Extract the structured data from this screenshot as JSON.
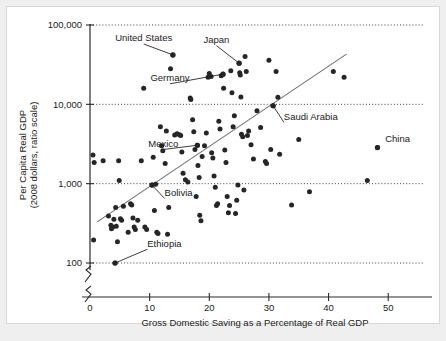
{
  "figure": {
    "background_color": "#efefef",
    "card_color": "#ffffff",
    "point_color": "#262626",
    "trend_color": "#6f6f6f"
  },
  "chart_data": {
    "type": "scatter",
    "title": "",
    "subtitle": "",
    "xlabel": "Gross Domestic Saving as a Percentage of Real GDP",
    "ylabel": "Per Capita Real GDP\n(2008 dollars, ratio scale)",
    "ylabel_line1": "Per Capita Real GDP",
    "ylabel_line2": "(2008 dollars, ratio scale)",
    "yscale": "log",
    "xscale": "linear",
    "xlim": [
      0,
      56
    ],
    "ylim": [
      100,
      100000
    ],
    "grid": true,
    "grid_axis": "y",
    "legend": "none",
    "xticks": [
      0,
      10,
      20,
      30,
      40,
      50
    ],
    "xtick_labels": [
      "0",
      "10",
      "20",
      "30",
      "40",
      "50"
    ],
    "yticks": [
      100,
      1000,
      10000,
      100000
    ],
    "ytick_labels": [
      "100",
      "1,000",
      "10,000",
      "100,000"
    ],
    "axis_break": true,
    "trendline": {
      "type": "linear-on-log",
      "x_start": 1.2,
      "y_start": 330,
      "x_end": 43.0,
      "y_end": 43000
    },
    "annotations": [
      {
        "label": "United States",
        "x": 13.9,
        "y": 42000,
        "label_x": 9.0,
        "label_y": 62000,
        "leader": true
      },
      {
        "label": "Japan",
        "x": 25.0,
        "y": 33000,
        "label_x": 21.2,
        "label_y": 59000,
        "leader": true
      },
      {
        "label": "Germany",
        "x": 22.3,
        "y": 24000,
        "label_x": 13.4,
        "label_y": 19500,
        "leader": true
      },
      {
        "label": "Saudi Arabia",
        "x": 30.7,
        "y": 9600,
        "label_x": 32.5,
        "label_y": 6400,
        "leader": true
      },
      {
        "label": "Mexico",
        "x": 18.0,
        "y": 3050,
        "label_x": 12.3,
        "label_y": 2900,
        "leader": true
      },
      {
        "label": "Bolivia",
        "x": 10.4,
        "y": 960,
        "label_x": 12.5,
        "label_y": 700,
        "leader": true
      },
      {
        "label": "Ethiopia",
        "x": 4.2,
        "y": 100,
        "label_x": 9.6,
        "label_y": 160,
        "leader": true
      },
      {
        "label": "China",
        "x": 48.2,
        "y": 2850,
        "label_x": 49.5,
        "label_y": 3400,
        "leader": false
      }
    ],
    "points": [
      {
        "x": 0.5,
        "y": 2300
      },
      {
        "x": 0.7,
        "y": 1850
      },
      {
        "x": 0.6,
        "y": 195
      },
      {
        "x": 2.2,
        "y": 1950
      },
      {
        "x": 3.1,
        "y": 390
      },
      {
        "x": 3.5,
        "y": 300
      },
      {
        "x": 3.6,
        "y": 270
      },
      {
        "x": 3.8,
        "y": 285
      },
      {
        "x": 4.0,
        "y": 355
      },
      {
        "x": 4.2,
        "y": 100
      },
      {
        "x": 4.3,
        "y": 500
      },
      {
        "x": 4.4,
        "y": 290
      },
      {
        "x": 4.6,
        "y": 185
      },
      {
        "x": 4.8,
        "y": 1950
      },
      {
        "x": 4.9,
        "y": 1100
      },
      {
        "x": 5.1,
        "y": 360
      },
      {
        "x": 5.3,
        "y": 345
      },
      {
        "x": 5.6,
        "y": 520
      },
      {
        "x": 6.4,
        "y": 245
      },
      {
        "x": 6.8,
        "y": 560
      },
      {
        "x": 7.0,
        "y": 540
      },
      {
        "x": 7.2,
        "y": 370
      },
      {
        "x": 7.4,
        "y": 285
      },
      {
        "x": 7.6,
        "y": 265
      },
      {
        "x": 8.0,
        "y": 345
      },
      {
        "x": 8.6,
        "y": 1950
      },
      {
        "x": 9.0,
        "y": 16000
      },
      {
        "x": 9.2,
        "y": 285
      },
      {
        "x": 9.5,
        "y": 265
      },
      {
        "x": 10.4,
        "y": 960
      },
      {
        "x": 10.6,
        "y": 2150
      },
      {
        "x": 10.8,
        "y": 460
      },
      {
        "x": 11.0,
        "y": 980
      },
      {
        "x": 11.2,
        "y": 245
      },
      {
        "x": 11.4,
        "y": 235
      },
      {
        "x": 11.8,
        "y": 5200
      },
      {
        "x": 12.0,
        "y": 3000
      },
      {
        "x": 12.2,
        "y": 2600
      },
      {
        "x": 12.6,
        "y": 1800
      },
      {
        "x": 12.8,
        "y": 4600
      },
      {
        "x": 13.0,
        "y": 230
      },
      {
        "x": 13.2,
        "y": 500
      },
      {
        "x": 13.5,
        "y": 28000
      },
      {
        "x": 13.9,
        "y": 42000
      },
      {
        "x": 14.2,
        "y": 4100
      },
      {
        "x": 14.6,
        "y": 4250
      },
      {
        "x": 15.0,
        "y": 4150
      },
      {
        "x": 15.2,
        "y": 4050
      },
      {
        "x": 15.4,
        "y": 2500
      },
      {
        "x": 15.6,
        "y": 1350
      },
      {
        "x": 16.0,
        "y": 1120
      },
      {
        "x": 16.4,
        "y": 1050
      },
      {
        "x": 16.8,
        "y": 12000
      },
      {
        "x": 16.9,
        "y": 11500
      },
      {
        "x": 17.2,
        "y": 6400
      },
      {
        "x": 17.4,
        "y": 4500
      },
      {
        "x": 17.6,
        "y": 2700
      },
      {
        "x": 17.8,
        "y": 690
      },
      {
        "x": 18.0,
        "y": 3050
      },
      {
        "x": 18.1,
        "y": 1700
      },
      {
        "x": 18.3,
        "y": 1200
      },
      {
        "x": 18.4,
        "y": 400
      },
      {
        "x": 18.6,
        "y": 340
      },
      {
        "x": 18.8,
        "y": 2200
      },
      {
        "x": 19.2,
        "y": 3000
      },
      {
        "x": 19.5,
        "y": 4350
      },
      {
        "x": 19.8,
        "y": 22000
      },
      {
        "x": 20.0,
        "y": 24500
      },
      {
        "x": 20.3,
        "y": 22500
      },
      {
        "x": 20.4,
        "y": 2450
      },
      {
        "x": 20.6,
        "y": 2100
      },
      {
        "x": 20.8,
        "y": 1250
      },
      {
        "x": 21.0,
        "y": 900
      },
      {
        "x": 21.2,
        "y": 530
      },
      {
        "x": 21.4,
        "y": 560
      },
      {
        "x": 21.6,
        "y": 6100
      },
      {
        "x": 21.8,
        "y": 4900
      },
      {
        "x": 22.0,
        "y": 23000
      },
      {
        "x": 22.3,
        "y": 24000
      },
      {
        "x": 22.4,
        "y": 16000
      },
      {
        "x": 22.6,
        "y": 2650
      },
      {
        "x": 22.8,
        "y": 1850
      },
      {
        "x": 23.0,
        "y": 690
      },
      {
        "x": 23.2,
        "y": 430
      },
      {
        "x": 23.4,
        "y": 530
      },
      {
        "x": 23.6,
        "y": 26500
      },
      {
        "x": 23.8,
        "y": 14000
      },
      {
        "x": 24.0,
        "y": 5200
      },
      {
        "x": 24.2,
        "y": 7200
      },
      {
        "x": 24.4,
        "y": 420
      },
      {
        "x": 24.6,
        "y": 620
      },
      {
        "x": 24.8,
        "y": 960
      },
      {
        "x": 25.0,
        "y": 33000
      },
      {
        "x": 25.1,
        "y": 25000
      },
      {
        "x": 25.2,
        "y": 23500
      },
      {
        "x": 25.3,
        "y": 12400
      },
      {
        "x": 25.4,
        "y": 4200
      },
      {
        "x": 25.6,
        "y": 3900
      },
      {
        "x": 25.8,
        "y": 830
      },
      {
        "x": 26.0,
        "y": 40000
      },
      {
        "x": 26.2,
        "y": 26000
      },
      {
        "x": 26.4,
        "y": 4050
      },
      {
        "x": 26.6,
        "y": 4600
      },
      {
        "x": 27.0,
        "y": 3100
      },
      {
        "x": 27.4,
        "y": 2050
      },
      {
        "x": 28.0,
        "y": 8300
      },
      {
        "x": 28.6,
        "y": 5100
      },
      {
        "x": 29.4,
        "y": 1900
      },
      {
        "x": 29.6,
        "y": 1800
      },
      {
        "x": 30.0,
        "y": 36000
      },
      {
        "x": 30.3,
        "y": 2700
      },
      {
        "x": 30.7,
        "y": 9600
      },
      {
        "x": 31.2,
        "y": 26000
      },
      {
        "x": 31.5,
        "y": 12300
      },
      {
        "x": 31.8,
        "y": 2350
      },
      {
        "x": 33.8,
        "y": 540
      },
      {
        "x": 35.0,
        "y": 3600
      },
      {
        "x": 36.8,
        "y": 790
      },
      {
        "x": 40.8,
        "y": 26000
      },
      {
        "x": 42.6,
        "y": 22000
      },
      {
        "x": 46.5,
        "y": 1100
      },
      {
        "x": 48.2,
        "y": 2850
      }
    ]
  }
}
